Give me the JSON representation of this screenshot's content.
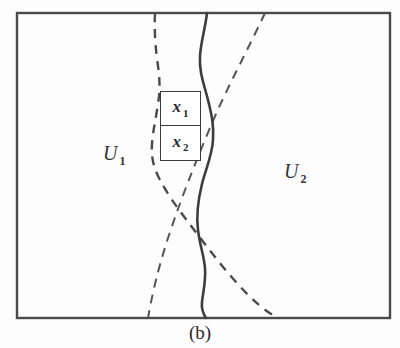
{
  "figure": {
    "caption": "(b)",
    "frame": {
      "x": 17,
      "y": 13,
      "width": 373,
      "height": 305,
      "stroke_color": "#4a4a4a",
      "stroke_width": 2.4
    },
    "background_color": "#fdfdfd",
    "regions": [
      {
        "id": "u1",
        "base": "U",
        "subscript": "1",
        "x": 103,
        "y": 143
      },
      {
        "id": "u2",
        "base": "U",
        "subscript": "2",
        "x": 284,
        "y": 161
      }
    ],
    "cell_box": {
      "x": 160,
      "y": 91,
      "width": 41,
      "height": 70,
      "stroke_color": "#3a3a3a",
      "cells": [
        {
          "id": "x1",
          "base": "x",
          "subscript": "1"
        },
        {
          "id": "x2",
          "base": "x",
          "subscript": "2"
        }
      ]
    },
    "curves": [
      {
        "id": "solid-boundary",
        "style": "solid",
        "stroke_color": "#3d3d3d",
        "stroke_width": 2.6,
        "dash": "",
        "path": "M 207 13 C 205 30 201 41 200 56 C 199 72 204 84 208 100 C 212 116 214 126 213 140 C 212 156 206 168 202 184 C 198 200 196 214 198 230 C 200 246 204 256 205 268 C 206 282 203 292 202 302 C 201 310 204 315 206 318"
      },
      {
        "id": "dashed-left",
        "style": "dashed",
        "stroke_color": "#4a4a4a",
        "stroke_width": 2.4,
        "dash": "9 7",
        "path": "M 155 13 C 154 34 156 52 158 66 C 160 80 160 92 158 104 C 156 118 153 130 152 144 C 151 158 154 168 159 178 C 166 192 176 206 188 222 C 202 240 218 262 236 282 C 252 300 266 312 278 318"
      },
      {
        "id": "dashed-right",
        "style": "dashed",
        "stroke_color": "#545454",
        "stroke_width": 2.0,
        "dash": "9 7",
        "path": "M 265 13 C 258 28 250 44 242 60 C 233 78 224 96 216 114 C 208 132 200 152 192 172 C 184 192 176 214 168 238 C 161 260 154 284 148 318"
      }
    ]
  }
}
